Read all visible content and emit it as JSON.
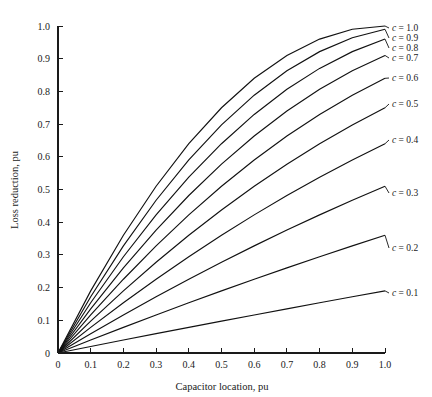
{
  "chart_data": {
    "type": "line",
    "title": "",
    "xlabel": "Capacitor location, pu",
    "ylabel": "Loss reduction, pu",
    "xlim": [
      0,
      1.0
    ],
    "ylim": [
      0,
      1.0
    ],
    "grid": false,
    "legend_position": "inline-right-end-labels",
    "x_ticks": [
      "0",
      "0.1",
      "0.2",
      "0.3",
      "0.4",
      "0.5",
      "0.6",
      "0.7",
      "0.8",
      "0.9",
      "1.0"
    ],
    "x_tick_values": [
      0,
      0.1,
      0.2,
      0.3,
      0.4,
      0.5,
      0.6,
      0.7,
      0.8,
      0.9,
      1.0
    ],
    "y_ticks": [
      "0",
      "0.1",
      "0.2",
      "0.3",
      "0.4",
      "0.5",
      "0.6",
      "0.7",
      "0.8",
      "0.9",
      "1.0"
    ],
    "y_tick_values": [
      0,
      0.1,
      0.2,
      0.3,
      0.4,
      0.5,
      0.6,
      0.7,
      0.8,
      0.9,
      1.0
    ],
    "x": [
      0,
      0.1,
      0.2,
      0.3,
      0.4,
      0.5,
      0.6,
      0.7,
      0.8,
      0.9,
      1.0
    ],
    "series": [
      {
        "name": "c = 0.1",
        "label_prefix": "c",
        "label_suffix": "= 0.1",
        "c": 0.1,
        "values": [
          0,
          0.0199,
          0.0396,
          0.0591,
          0.0784,
          0.0975,
          0.1164,
          0.1351,
          0.1536,
          0.1719,
          0.19
        ]
      },
      {
        "name": "c = 0.2",
        "label_prefix": "c",
        "label_suffix": "= 0.2",
        "c": 0.2,
        "values": [
          0,
          0.0396,
          0.0784,
          0.1164,
          0.1536,
          0.19,
          0.2256,
          0.2604,
          0.2944,
          0.3276,
          0.36
        ]
      },
      {
        "name": "c = 0.3",
        "label_prefix": "c",
        "label_suffix": "= 0.3",
        "c": 0.3,
        "values": [
          0,
          0.0591,
          0.1164,
          0.1719,
          0.2256,
          0.2775,
          0.3276,
          0.3759,
          0.4224,
          0.4671,
          0.51
        ]
      },
      {
        "name": "c = 0.4",
        "label_prefix": "c",
        "label_suffix": "= 0.4",
        "c": 0.4,
        "values": [
          0,
          0.0784,
          0.1536,
          0.2256,
          0.2944,
          0.36,
          0.4224,
          0.4816,
          0.5376,
          0.5904,
          0.64
        ]
      },
      {
        "name": "c = 0.5",
        "label_prefix": "c",
        "label_suffix": "= 0.5",
        "c": 0.5,
        "values": [
          0,
          0.0975,
          0.19,
          0.2775,
          0.36,
          0.4375,
          0.51,
          0.5775,
          0.64,
          0.6975,
          0.75
        ]
      },
      {
        "name": "c = 0.6",
        "label_prefix": "c",
        "label_suffix": "= 0.6",
        "c": 0.6,
        "values": [
          0,
          0.1164,
          0.2256,
          0.3276,
          0.4224,
          0.51,
          0.5904,
          0.6636,
          0.7296,
          0.7884,
          0.84
        ]
      },
      {
        "name": "c = 0.7",
        "label_prefix": "c",
        "label_suffix": "= 0.7",
        "c": 0.7,
        "values": [
          0,
          0.1351,
          0.2604,
          0.3759,
          0.4816,
          0.5775,
          0.6636,
          0.7399,
          0.8064,
          0.8631,
          0.91
        ]
      },
      {
        "name": "c = 0.8",
        "label_prefix": "c",
        "label_suffix": "= 0.8",
        "c": 0.8,
        "values": [
          0,
          0.1536,
          0.2944,
          0.4224,
          0.5376,
          0.64,
          0.7296,
          0.8064,
          0.8704,
          0.9216,
          0.96
        ]
      },
      {
        "name": "c = 0.9",
        "label_prefix": "c",
        "label_suffix": "= 0.9",
        "c": 0.9,
        "values": [
          0,
          0.1719,
          0.3276,
          0.4671,
          0.5904,
          0.6975,
          0.7884,
          0.8631,
          0.9216,
          0.9639,
          0.99
        ]
      },
      {
        "name": "c = 1.0",
        "label_prefix": "c",
        "label_suffix": "= 1.0",
        "c": 1.0,
        "values": [
          0,
          0.19,
          0.36,
          0.51,
          0.64,
          0.75,
          0.84,
          0.91,
          0.96,
          0.99,
          1.0
        ]
      }
    ],
    "annotations": [
      {
        "text": "c = 1.0",
        "x": 1.0,
        "y": 1.0
      },
      {
        "text": "c = 0.9",
        "x": 1.0,
        "y": 0.99
      },
      {
        "text": "c = 0.8",
        "x": 1.0,
        "y": 0.96
      },
      {
        "text": "c = 0.7",
        "x": 1.0,
        "y": 0.91
      },
      {
        "text": "c = 0.6",
        "x": 1.0,
        "y": 0.84
      },
      {
        "text": "c = 0.5",
        "x": 1.0,
        "y": 0.75
      },
      {
        "text": "c = 0.4",
        "x": 1.0,
        "y": 0.64
      },
      {
        "text": "c = 0.3",
        "x": 1.0,
        "y": 0.51
      },
      {
        "text": "c = 0.2",
        "x": 1.0,
        "y": 0.36
      },
      {
        "text": "c = 0.1",
        "x": 1.0,
        "y": 0.19
      }
    ]
  }
}
